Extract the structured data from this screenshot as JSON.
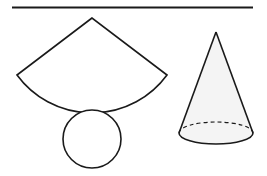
{
  "diagram": {
    "title": "",
    "colors": {
      "stroke": "#1a1a1a",
      "background": "#ffffff",
      "cone_fill": "#f4f4f4"
    },
    "elements": [
      {
        "id": "top-rule",
        "type": "line"
      },
      {
        "id": "net-sector",
        "type": "sector",
        "label": ""
      },
      {
        "id": "net-base-circle",
        "type": "circle",
        "label": ""
      },
      {
        "id": "cone-3d",
        "type": "cone",
        "label": ""
      }
    ]
  }
}
